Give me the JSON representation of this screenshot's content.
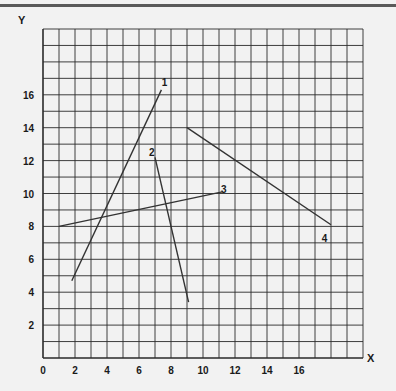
{
  "chart_data": {
    "type": "line",
    "title": "",
    "xlabel": "X",
    "ylabel": "Y",
    "xlim": [
      0,
      20
    ],
    "ylim": [
      0,
      20
    ],
    "grid": true,
    "x_ticks": [
      0,
      2,
      4,
      6,
      8,
      10,
      12,
      14,
      16
    ],
    "y_ticks": [
      2,
      4,
      6,
      8,
      10,
      12,
      14,
      16
    ],
    "series": [
      {
        "name": "1",
        "x": [
          1.8,
          7.4
        ],
        "y": [
          4.7,
          16.3
        ],
        "label_pos": [
          7.6,
          16.8
        ]
      },
      {
        "name": "2",
        "x": [
          7.0,
          9.1
        ],
        "y": [
          12.2,
          3.4
        ],
        "label_pos": [
          6.8,
          12.5
        ]
      },
      {
        "name": "3",
        "x": [
          1.0,
          11.2
        ],
        "y": [
          8.0,
          10.1
        ],
        "label_pos": [
          11.3,
          10.3
        ]
      },
      {
        "name": "4",
        "x": [
          9.0,
          18.0
        ],
        "y": [
          14.0,
          8.1
        ],
        "label_pos": [
          17.6,
          7.3
        ]
      }
    ]
  },
  "colors": {
    "background": "#f2f2f2",
    "grid": "#2a2a2a",
    "line": "#333333",
    "top_rule": "#5a5a5a"
  }
}
